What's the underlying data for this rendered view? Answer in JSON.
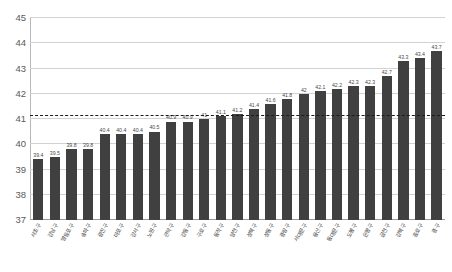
{
  "chart_data": {
    "type": "bar",
    "title": "",
    "subtitle": "",
    "xlabel": "",
    "ylabel": "",
    "ylim": [
      37,
      45
    ],
    "ytick_labels": [
      "45",
      "44",
      "43",
      "42",
      "41",
      "40",
      "39",
      "38",
      "37"
    ],
    "yticks": [
      45,
      44,
      43,
      42,
      41,
      40,
      39,
      38,
      37
    ],
    "grid": true,
    "legend_position": "none",
    "bar_color": "#404040",
    "reference_line": {
      "value": 41.1,
      "style": "dashed",
      "color": "#1b1b1b",
      "label": ""
    },
    "categories": [
      "서초구",
      "강남구",
      "영등포구",
      "송파구",
      "광진구",
      "마포구",
      "강서구",
      "노원구",
      "관악구",
      "강동구",
      "구로구",
      "동작구",
      "양천구",
      "성북구",
      "성동구",
      "중랑구",
      "서대문구",
      "용산구",
      "동대문구",
      "도봉구",
      "은평구",
      "금천구",
      "강북구",
      "종로구",
      "중구"
    ],
    "values": [
      39.4,
      39.5,
      39.8,
      39.8,
      40.4,
      40.4,
      40.4,
      40.5,
      40.9,
      40.9,
      41.0,
      41.1,
      41.2,
      41.4,
      41.6,
      41.8,
      42.0,
      42.1,
      42.2,
      42.3,
      42.3,
      42.7,
      43.3,
      43.4,
      43.7
    ],
    "value_labels": [
      "39.4",
      "39.5",
      "39.8",
      "39.8",
      "40.4",
      "40.4",
      "40.4",
      "40.5",
      "40.9",
      "40.9",
      "41",
      "41.1",
      "41.2",
      "41.4",
      "41.6",
      "41.8",
      "42",
      "42.1",
      "42.2",
      "42.3",
      "42.3",
      "42.7",
      "43.3",
      "43.4",
      "43.7"
    ]
  }
}
